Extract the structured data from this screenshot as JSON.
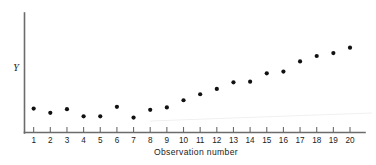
{
  "chart_data": {
    "type": "scatter",
    "title": "",
    "xlabel": "Observation number",
    "ylabel": "Y",
    "categories": [
      1,
      2,
      3,
      4,
      5,
      6,
      7,
      8,
      9,
      10,
      11,
      12,
      13,
      14,
      15,
      16,
      17,
      18,
      19,
      20
    ],
    "x": [
      1,
      2,
      3,
      4,
      5,
      6,
      7,
      8,
      9,
      10,
      11,
      12,
      13,
      14,
      15,
      16,
      17,
      18,
      19,
      20
    ],
    "values": [
      20.0,
      16.5,
      19.5,
      13.5,
      13.5,
      21.5,
      12.5,
      19.0,
      21.0,
      27.0,
      32.0,
      36.5,
      42.0,
      42.5,
      49.5,
      51.0,
      59.5,
      64.0,
      66.5,
      71.0
    ],
    "series": [
      {
        "name": "Y",
        "values": [
          20.0,
          16.5,
          19.5,
          13.5,
          13.5,
          21.5,
          12.5,
          19.0,
          21.0,
          27.0,
          32.0,
          36.5,
          42.0,
          42.5,
          49.5,
          51.0,
          59.5,
          64.0,
          66.5,
          71.0
        ]
      }
    ],
    "xlim": [
      0.45,
      20.9
    ],
    "ylim": [
      0,
      100
    ],
    "xticks": [
      1,
      2,
      3,
      4,
      5,
      6,
      7,
      8,
      9,
      10,
      11,
      12,
      13,
      14,
      15,
      16,
      17,
      18,
      19,
      20
    ],
    "xticklabels": [
      "1",
      "2",
      "3",
      "4",
      "5",
      "6",
      "7",
      "8",
      "9",
      "10",
      "11",
      "12",
      "13",
      "14",
      "15",
      "16",
      "17",
      "18",
      "19",
      "20"
    ],
    "yticks": [],
    "yticklabels": [],
    "grid": false,
    "legend": false,
    "legend_position": "none",
    "marker": "filled-circle",
    "marker_color": "#111111",
    "axis_color": "#6b6b6b",
    "background_color": "#ffffff",
    "annotations": []
  },
  "figure": {
    "axis_label_y": "Y",
    "axis_label_x": "Observation number"
  }
}
